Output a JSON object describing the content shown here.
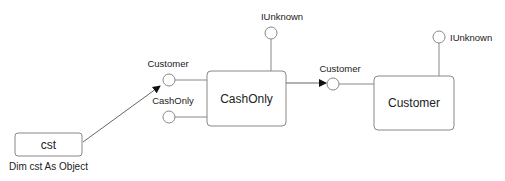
{
  "diagram": {
    "colors": {
      "stroke": "#7a7a7a",
      "box_stroke": "#888888",
      "text": "#222222",
      "arrow": "#111111"
    },
    "variable": {
      "box_label": "cst",
      "caption": "Dim cst As Object"
    },
    "cashonly_object": {
      "box_label": "CashOnly",
      "interfaces": [
        {
          "label": "Customer"
        },
        {
          "label": "CashOnly"
        },
        {
          "label": "IUnknown"
        }
      ]
    },
    "customer_object": {
      "box_label": "Customer",
      "interfaces": [
        {
          "label": "Customer"
        },
        {
          "label": "IUnknown"
        }
      ]
    }
  }
}
